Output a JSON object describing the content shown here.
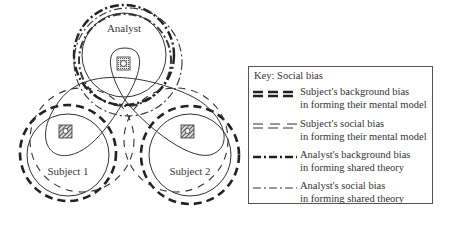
{
  "diagram": {
    "nodes": [
      {
        "id": "analyst",
        "label": "Analyst",
        "icon": "person-in-box-icon"
      },
      {
        "id": "subject1",
        "label": "Subject 1",
        "icon": "person-in-hatched-box-icon"
      },
      {
        "id": "subject2",
        "label": "Subject 2",
        "icon": "person-in-hatched-box-icon"
      }
    ],
    "colors": {
      "line": "#2a2a2a",
      "background": "#ffffff"
    }
  },
  "key": {
    "title": "Key: Social bias",
    "items": [
      {
        "line_style": "heavy-dashed",
        "line1": "Subject's background bias",
        "line2": "in forming their mental model"
      },
      {
        "line_style": "thin-dashed",
        "line1": "Subject's social bias",
        "line2": "in forming their mental model"
      },
      {
        "line_style": "heavy-dash-dot",
        "line1": "Analyst's background bias",
        "line2": "in forming shared theory"
      },
      {
        "line_style": "thin-dash-dot",
        "line1": "Analyst's social bias",
        "line2": "in forming shared theory"
      }
    ]
  }
}
